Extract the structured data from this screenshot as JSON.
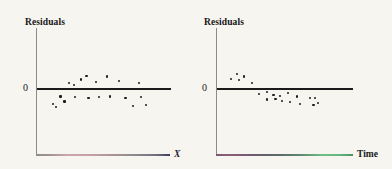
{
  "figure": {
    "background_color": "#f7f5ef",
    "dot_color": "#1c1c1c",
    "zero_line_color": "#1a1a1a",
    "vertical_axis_color": "#8b8b8b"
  },
  "panels": [
    {
      "id": "left",
      "y_axis_label": "Residuals",
      "zero_tick_label": "0",
      "x_axis_label": "X",
      "x_axis_label_style": "italic",
      "x_axis_gradient": "gray-to-rose-to-navy"
    },
    {
      "id": "right",
      "y_axis_label": "Residuals",
      "zero_tick_label": "0",
      "x_axis_label": "Time",
      "x_axis_label_style": "upright",
      "x_axis_gradient": "purple-to-green"
    }
  ],
  "chart_data": [
    {
      "type": "scatter",
      "title": "",
      "subtitle": "",
      "xlabel": "X",
      "ylabel": "Residuals",
      "ytick_labels": [
        "0"
      ],
      "yticks": [
        0
      ],
      "grid": false,
      "legend": false,
      "reference_line": {
        "y": 0,
        "label": "0",
        "style": "solid-thick"
      },
      "annotation": "Residuals scattered randomly above and below zero (no pattern)",
      "xlim": [
        0,
        100
      ],
      "ylim": [
        -10,
        10
      ],
      "points": [
        {
          "x": 12.0,
          "y": -4.2
        },
        {
          "x": 14.0,
          "y": -5.0
        },
        {
          "x": 17.5,
          "y": -2.2
        },
        {
          "x": 20.5,
          "y": -3.5
        },
        {
          "x": 24.0,
          "y": 1.4
        },
        {
          "x": 27.5,
          "y": 0.8
        },
        {
          "x": 28.5,
          "y": -2.4
        },
        {
          "x": 33.0,
          "y": 2.2
        },
        {
          "x": 37.0,
          "y": 3.2
        },
        {
          "x": 38.5,
          "y": -2.6
        },
        {
          "x": 44.0,
          "y": 1.5
        },
        {
          "x": 46.5,
          "y": -2.4
        },
        {
          "x": 52.0,
          "y": 3.0
        },
        {
          "x": 54.5,
          "y": -2.2
        },
        {
          "x": 61.5,
          "y": 1.9
        },
        {
          "x": 66.0,
          "y": -2.6
        },
        {
          "x": 71.5,
          "y": -4.6
        },
        {
          "x": 76.0,
          "y": 1.2
        },
        {
          "x": 77.5,
          "y": -2.4
        },
        {
          "x": 81.5,
          "y": -4.4
        }
      ]
    },
    {
      "type": "scatter",
      "title": "",
      "subtitle": "",
      "xlabel": "Time",
      "ylabel": "Residuals",
      "ytick_labels": [
        "0"
      ],
      "yticks": [
        0
      ],
      "grid": false,
      "legend": false,
      "reference_line": {
        "y": 0,
        "label": "0",
        "style": "solid-thick"
      },
      "annotation": "Residuals trend downward over time (systematic pattern)",
      "xlim": [
        0,
        100
      ],
      "ylim": [
        -10,
        10
      ],
      "points": [
        {
          "x": 10.0,
          "y": 2.4
        },
        {
          "x": 14.5,
          "y": 3.6
        },
        {
          "x": 16.0,
          "y": 2.0
        },
        {
          "x": 20.0,
          "y": 3.0
        },
        {
          "x": 25.5,
          "y": 1.4
        },
        {
          "x": 31.0,
          "y": -1.6
        },
        {
          "x": 36.5,
          "y": -1.0
        },
        {
          "x": 37.0,
          "y": -3.0
        },
        {
          "x": 41.5,
          "y": -1.8
        },
        {
          "x": 43.0,
          "y": -2.8
        },
        {
          "x": 46.5,
          "y": -2.0
        },
        {
          "x": 47.5,
          "y": -3.4
        },
        {
          "x": 52.0,
          "y": -1.4
        },
        {
          "x": 53.5,
          "y": -3.6
        },
        {
          "x": 59.0,
          "y": -2.2
        },
        {
          "x": 61.0,
          "y": -4.2
        },
        {
          "x": 68.5,
          "y": -2.6
        },
        {
          "x": 72.0,
          "y": -2.6
        },
        {
          "x": 71.0,
          "y": -4.4
        },
        {
          "x": 74.5,
          "y": -3.8
        }
      ]
    }
  ]
}
